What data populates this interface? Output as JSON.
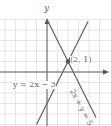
{
  "diagram": {
    "type": "coordinate-plane-system-of-equations",
    "axes": {
      "y_label": "y"
    },
    "intersection": {
      "label": "(2, 1)",
      "x": 2,
      "y": 1
    },
    "lines": [
      {
        "equation_label": "y = 2x − 3",
        "slope": 2,
        "intercept": -3
      },
      {
        "equation_label": "2x + y = 5",
        "slope": -2,
        "intercept": 5
      }
    ],
    "colors": {
      "grid": "#dddddd",
      "axis": "#555555",
      "line": "#666666",
      "text": "#666666"
    }
  }
}
